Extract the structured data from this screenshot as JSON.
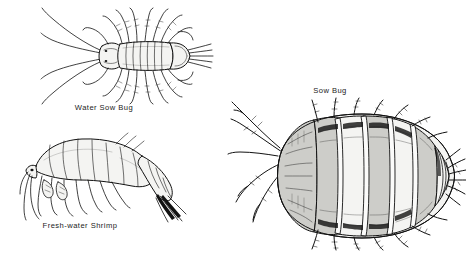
{
  "plate": {
    "title": "",
    "background_color": "#ffffff",
    "ink_color": "#121212",
    "width": 466,
    "height": 258,
    "style": "pen-and-ink scientific illustration",
    "figure_count": 3
  },
  "figures": [
    {
      "id": "water-sow-bug",
      "caption": "Water Sow Bug",
      "view": "dorsal",
      "position": {
        "x": 30,
        "y": 8,
        "width": 180,
        "height": 95
      },
      "caption_position": {
        "x": 68,
        "y": 105
      },
      "segments": 7,
      "leg_pairs": 7,
      "antennae": 2
    },
    {
      "id": "fresh-water-shrimp",
      "caption": "Fresh-water Shrimp",
      "view": "lateral",
      "position": {
        "x": 22,
        "y": 132,
        "width": 165,
        "height": 90
      },
      "caption_position": {
        "x": 44,
        "y": 223
      },
      "segments": 8,
      "leg_pairs": 7,
      "antennae": 2
    },
    {
      "id": "sow-bug",
      "caption": "Sow Bug",
      "view": "dorsal",
      "position": {
        "x": 222,
        "y": 100,
        "width": 244,
        "height": 150
      },
      "caption_position": {
        "x": 330,
        "y": 88
      },
      "segments": 7,
      "leg_pairs": 7,
      "antennae": 2
    }
  ],
  "captions": {
    "water_sow_bug": "Water Sow Bug",
    "fresh_water_shrimp": "Fresh-water Shrimp",
    "sow_bug": "Sow Bug"
  }
}
